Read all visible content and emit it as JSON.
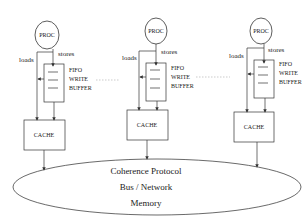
{
  "diagram": {
    "type": "multiprocessor-write-buffer-architecture",
    "nodes": [
      {
        "proc_label": "PROC",
        "stores_label": "stores",
        "loads_label": "loads",
        "buffer_lines": [
          "FIFO",
          "WRITE",
          "BUFFER"
        ],
        "cache_label": "CACHE"
      },
      {
        "proc_label": "PROC",
        "stores_label": "stores",
        "loads_label": "loads",
        "buffer_lines": [
          "FIFO",
          "WRITE",
          "BUFFER"
        ],
        "cache_label": "CACHE"
      },
      {
        "proc_label": "PROC",
        "stores_label": "stores",
        "loads_label": "loads",
        "buffer_lines": [
          "FIFO",
          "WRITE",
          "BUFFER"
        ],
        "cache_label": "CACHE"
      }
    ],
    "shared": {
      "lines": [
        "Coherence Protocol",
        "Bus / Network",
        "Memory"
      ]
    }
  },
  "colors": {
    "stroke": "#333333",
    "dotted": "#aaaaaa",
    "background": "#ffffff"
  }
}
